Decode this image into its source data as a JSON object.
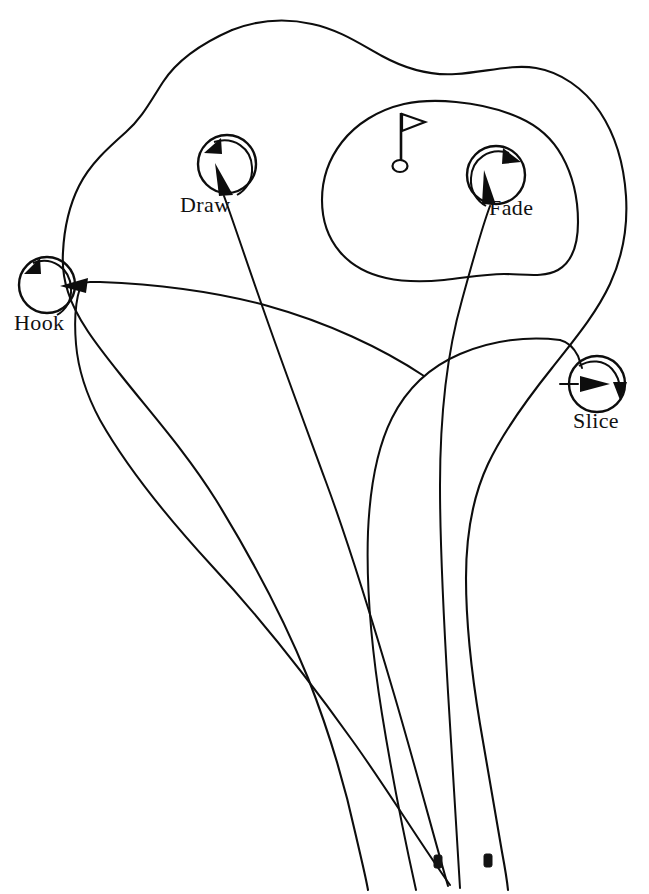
{
  "figure": {
    "kind": "golf-shot-shape-diagram",
    "background_color": "#ffffff",
    "ink_color": "#0d0d0d"
  },
  "course": {
    "fairway_name": "fairway-outline",
    "green_name": "green-outline",
    "pin": {
      "name": "flagstick",
      "flag_name": "flag-banner",
      "cup_name": "hole-cup"
    },
    "tee_markers": [
      {
        "name": "tee-marker-left",
        "x": 437,
        "y": 858
      },
      {
        "name": "tee-marker-right",
        "x": 487,
        "y": 857
      }
    ]
  },
  "shots": [
    {
      "id": "hook",
      "label": "Hook",
      "spin": "counterclockwise",
      "curve": "right-to-left-severe",
      "label_x": 14,
      "label_y": 330,
      "circle_cx": 47,
      "circle_cy": 285,
      "circle_r": 28
    },
    {
      "id": "draw",
      "label": "Draw",
      "spin": "counterclockwise",
      "curve": "right-to-left-gentle",
      "label_x": 180,
      "label_y": 212,
      "circle_cx": 227,
      "circle_cy": 164,
      "circle_r": 29
    },
    {
      "id": "fade",
      "label": "Fade",
      "spin": "clockwise",
      "curve": "left-to-right-gentle",
      "label_x": 489,
      "label_y": 215,
      "circle_cx": 496,
      "circle_cy": 175,
      "circle_r": 29
    },
    {
      "id": "slice",
      "label": "Slice",
      "spin": "clockwise",
      "curve": "left-to-right-severe",
      "label_x": 573,
      "label_y": 428,
      "circle_cx": 597,
      "circle_cy": 384,
      "circle_r": 28
    }
  ]
}
